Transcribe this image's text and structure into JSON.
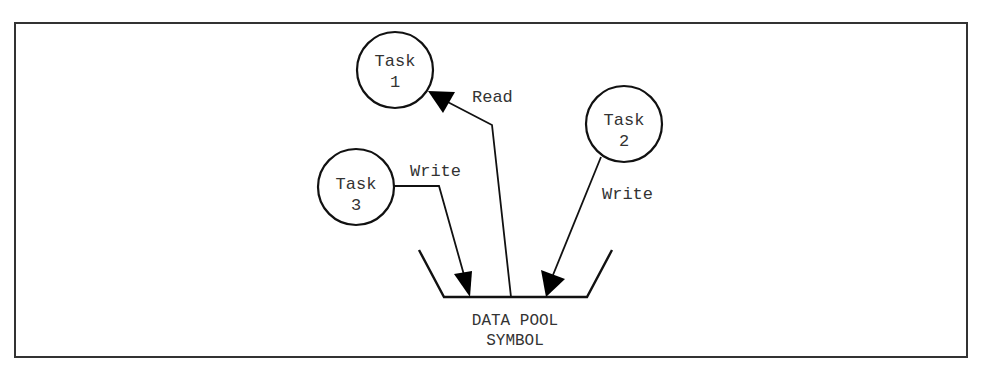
{
  "diagram": {
    "tasks": [
      {
        "id": "task1",
        "line1": "Task",
        "line2": "1"
      },
      {
        "id": "task2",
        "line1": "Task",
        "line2": "2"
      },
      {
        "id": "task3",
        "line1": "Task",
        "line2": "3"
      }
    ],
    "flows": [
      {
        "from": "data-pool",
        "to": "task1",
        "label": "Read"
      },
      {
        "from": "task2",
        "to": "data-pool",
        "label": "Write"
      },
      {
        "from": "task3",
        "to": "data-pool",
        "label": "Write"
      }
    ],
    "pool": {
      "line1": "DATA POOL",
      "line2": "SYMBOL"
    },
    "colors": {
      "stroke": "#111111",
      "text": "#333333",
      "background": "#ffffff"
    }
  }
}
